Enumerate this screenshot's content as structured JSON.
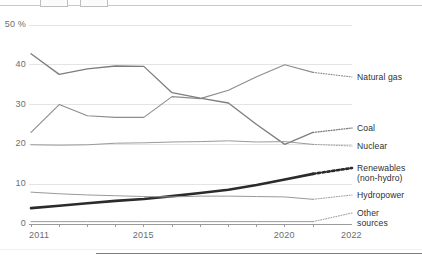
{
  "chart_data": {
    "type": "line",
    "title": "",
    "subtitle": "",
    "xlabel": "",
    "ylabel": "50 %",
    "grid": true,
    "legend_position": "right-inline",
    "xlim": [
      2011,
      2022
    ],
    "ylim": [
      0,
      50
    ],
    "x": [
      2011,
      2012,
      2013,
      2014,
      2015,
      2016,
      2017,
      2018,
      2019,
      2020,
      2021
    ],
    "yticks": [
      0,
      10,
      20,
      30,
      40,
      50
    ],
    "ytick_labels": [
      "0",
      "10",
      "20",
      "30",
      "40",
      "50 %"
    ],
    "xticks": [
      2011,
      2012,
      2013,
      2014,
      2015,
      2016,
      2017,
      2018,
      2019,
      2020,
      2021,
      2022
    ],
    "xtick_labels": [
      "2011",
      "2015",
      "2020",
      "2022"
    ],
    "xtick_label_years": [
      2011,
      2015,
      2020,
      2022
    ],
    "series": [
      {
        "name": "Natural gas",
        "color": "#8d8d8d",
        "width": 1.1,
        "values": [
          23.0,
          30.0,
          27.2,
          26.8,
          26.8,
          32.0,
          31.5,
          33.6,
          37.0,
          40.0,
          38.1
        ],
        "projected_from": 2021
      },
      {
        "name": "Coal",
        "color": "#7d7d7d",
        "width": 1.3,
        "values": [
          42.8,
          37.6,
          39.0,
          39.7,
          39.6,
          33.0,
          31.6,
          30.4,
          25.0,
          20.0,
          23.0
        ],
        "projected_from": 2021
      },
      {
        "name": "Nuclear",
        "color": "#9a9a9a",
        "width": 1.0,
        "values": [
          19.9,
          19.8,
          19.9,
          20.3,
          20.4,
          20.6,
          20.7,
          20.9,
          20.6,
          20.7,
          20.0
        ],
        "projected_from": 2021
      },
      {
        "name": "Renewables\n(non-hydro)",
        "color": "#2b2b2b",
        "width": 2.6,
        "values": [
          4.0,
          4.6,
          5.2,
          5.8,
          6.3,
          7.0,
          7.8,
          8.6,
          9.8,
          11.2,
          12.6
        ],
        "projected_from": 2021
      },
      {
        "name": "Hydropower",
        "color": "#9a9a9a",
        "width": 1.0,
        "values": [
          8.0,
          7.6,
          7.3,
          7.1,
          6.9,
          6.8,
          7.0,
          7.0,
          6.9,
          6.8,
          6.2
        ],
        "projected_from": 2021
      },
      {
        "name": "Other\nsources",
        "color": "#9a9a9a",
        "width": 1.0,
        "values": [
          0.6,
          0.6,
          0.6,
          0.6,
          0.6,
          0.6,
          0.6,
          0.6,
          0.6,
          0.6,
          0.6
        ],
        "projected_from": 2021
      }
    ]
  },
  "axis": {
    "y_labels": [
      {
        "text": "50 %",
        "value": 50
      },
      {
        "text": "40",
        "value": 40
      },
      {
        "text": "30",
        "value": 30
      },
      {
        "text": "20",
        "value": 20
      },
      {
        "text": "10",
        "value": 10
      },
      {
        "text": "0",
        "value": 0
      }
    ],
    "x_labels": [
      {
        "text": "2011",
        "value": 2011
      },
      {
        "text": "2015",
        "value": 2015
      },
      {
        "text": "2020",
        "value": 2020
      },
      {
        "text": "2022",
        "value": 2022
      }
    ]
  },
  "legend": {
    "items": [
      {
        "label": "Natural gas",
        "label_line2": "",
        "y_px": 77
      },
      {
        "label": "Coal",
        "label_line2": "",
        "y_px": 128
      },
      {
        "label": "Nuclear",
        "label_line2": "",
        "y_px": 146
      },
      {
        "label": "Renewables",
        "label_line2": "(non-hydro)",
        "y_px": 168
      },
      {
        "label": "Hydropower",
        "label_line2": "",
        "y_px": 195
      },
      {
        "label": "Other",
        "label_line2": "sources",
        "y_px": 213
      }
    ]
  },
  "colors": {
    "gridline": "#e4e4e4",
    "axis": "#9a9a9a",
    "text": "#6d6d6d",
    "legend_text": "#2f2f2f",
    "accent_renewables": "#2b2b2b",
    "background": "#ffffff"
  }
}
